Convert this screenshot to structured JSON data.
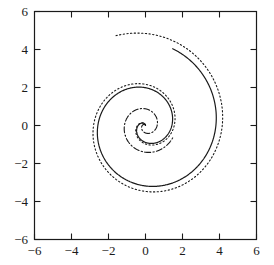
{
  "chart_data": {
    "type": "line",
    "title": "",
    "subtitle": "",
    "xlabel": "",
    "ylabel": "",
    "xlim": [
      -6,
      6
    ],
    "ylim": [
      -6,
      6
    ],
    "grid": false,
    "legend": "none",
    "frame": "box",
    "tick_direction": "in",
    "xticks": [
      -6,
      -4,
      -2,
      0,
      2,
      4,
      6
    ],
    "yticks": [
      -6,
      -4,
      -2,
      0,
      2,
      4,
      6
    ],
    "xtick_labels": [
      "−6",
      "−4",
      "−2",
      "0",
      "2",
      "4",
      "6"
    ],
    "ytick_labels": [
      "−6",
      "−4",
      "−2",
      "0",
      "2",
      "4",
      "6"
    ],
    "background_color": "#ffffff",
    "axis_color": "#1a1a1a",
    "series": [
      {
        "name": "outer-dotted-spiral",
        "linestyle": "dotted",
        "color": "#1a1a1a",
        "linewidth": 1.1,
        "description": "Outermost spiral, dotted line style",
        "spiral_model": "r = a + b*theta",
        "theta_start_deg": 90,
        "theta_end_deg": 830,
        "r_start": 0.0,
        "r_end": 5.0,
        "r_max": 5.0,
        "extents": {
          "left": -5.0,
          "right": 4.95,
          "top": 4.95,
          "bottom": -4.8
        }
      },
      {
        "name": "middle-solid-spiral",
        "linestyle": "solid",
        "color": "#1a1a1a",
        "linewidth": 1.2,
        "description": "Middle spiral, solid line style",
        "spiral_model": "r = a + b*theta",
        "theta_start_deg": 90,
        "theta_end_deg": 790,
        "r_start": 0.0,
        "r_end": 4.3,
        "r_max": 4.3,
        "extents": {
          "left": -4.25,
          "right": 4.0,
          "top": 4.25,
          "bottom": -4.35
        }
      },
      {
        "name": "inner-dashdot-spiral",
        "linestyle": "dashdot",
        "color": "#1a1a1a",
        "linewidth": 1.1,
        "description": "Innermost spiral, dash-dot line style",
        "spiral_model": "r = a + b*theta",
        "theta_start_deg": 90,
        "theta_end_deg": 700,
        "r_start": 0.0,
        "r_end": 1.62,
        "r_max": 1.62,
        "extents": {
          "left": -1.62,
          "right": 1.6,
          "top": 1.62,
          "bottom": -1.62
        }
      }
    ]
  },
  "axes": {
    "x_tick_labels": [
      "−6",
      "−4",
      "−2",
      "0",
      "2",
      "4",
      "6"
    ],
    "y_tick_labels": [
      "6",
      "4",
      "2",
      "0",
      "−2",
      "−4",
      "−6"
    ]
  }
}
